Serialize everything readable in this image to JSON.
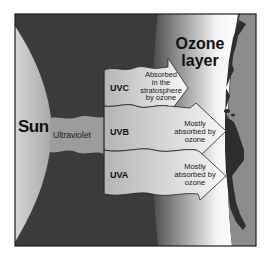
{
  "diagram": {
    "sun": {
      "label": "Sun"
    },
    "beam": {
      "label": "Ultraviolet"
    },
    "ozone_layer": {
      "label_line1": "Ozone",
      "label_line2": "layer"
    },
    "bands": [
      {
        "name": "UVC",
        "desc_line1": "Absorbed",
        "desc_line2": "in the",
        "desc_line3": "stratosphere",
        "desc_line4": "by ozone"
      },
      {
        "name": "UVB",
        "desc_line1": "Mostly",
        "desc_line2": "absorbed by",
        "desc_line3": "ozone"
      },
      {
        "name": "UVA",
        "desc_line1": "Mostly",
        "desc_line2": "absorbed by",
        "desc_line3": "ozone"
      }
    ],
    "colors": {
      "background_space": "#3b3b3b",
      "sun": "#b9b9b9",
      "beam": "#9c9c9c",
      "band_fill": "#c8c8c8",
      "ozone": "#ffffff",
      "earth": "#8c8c8c",
      "land": "#2e2e2e",
      "frame": "#1e1e1e"
    }
  }
}
